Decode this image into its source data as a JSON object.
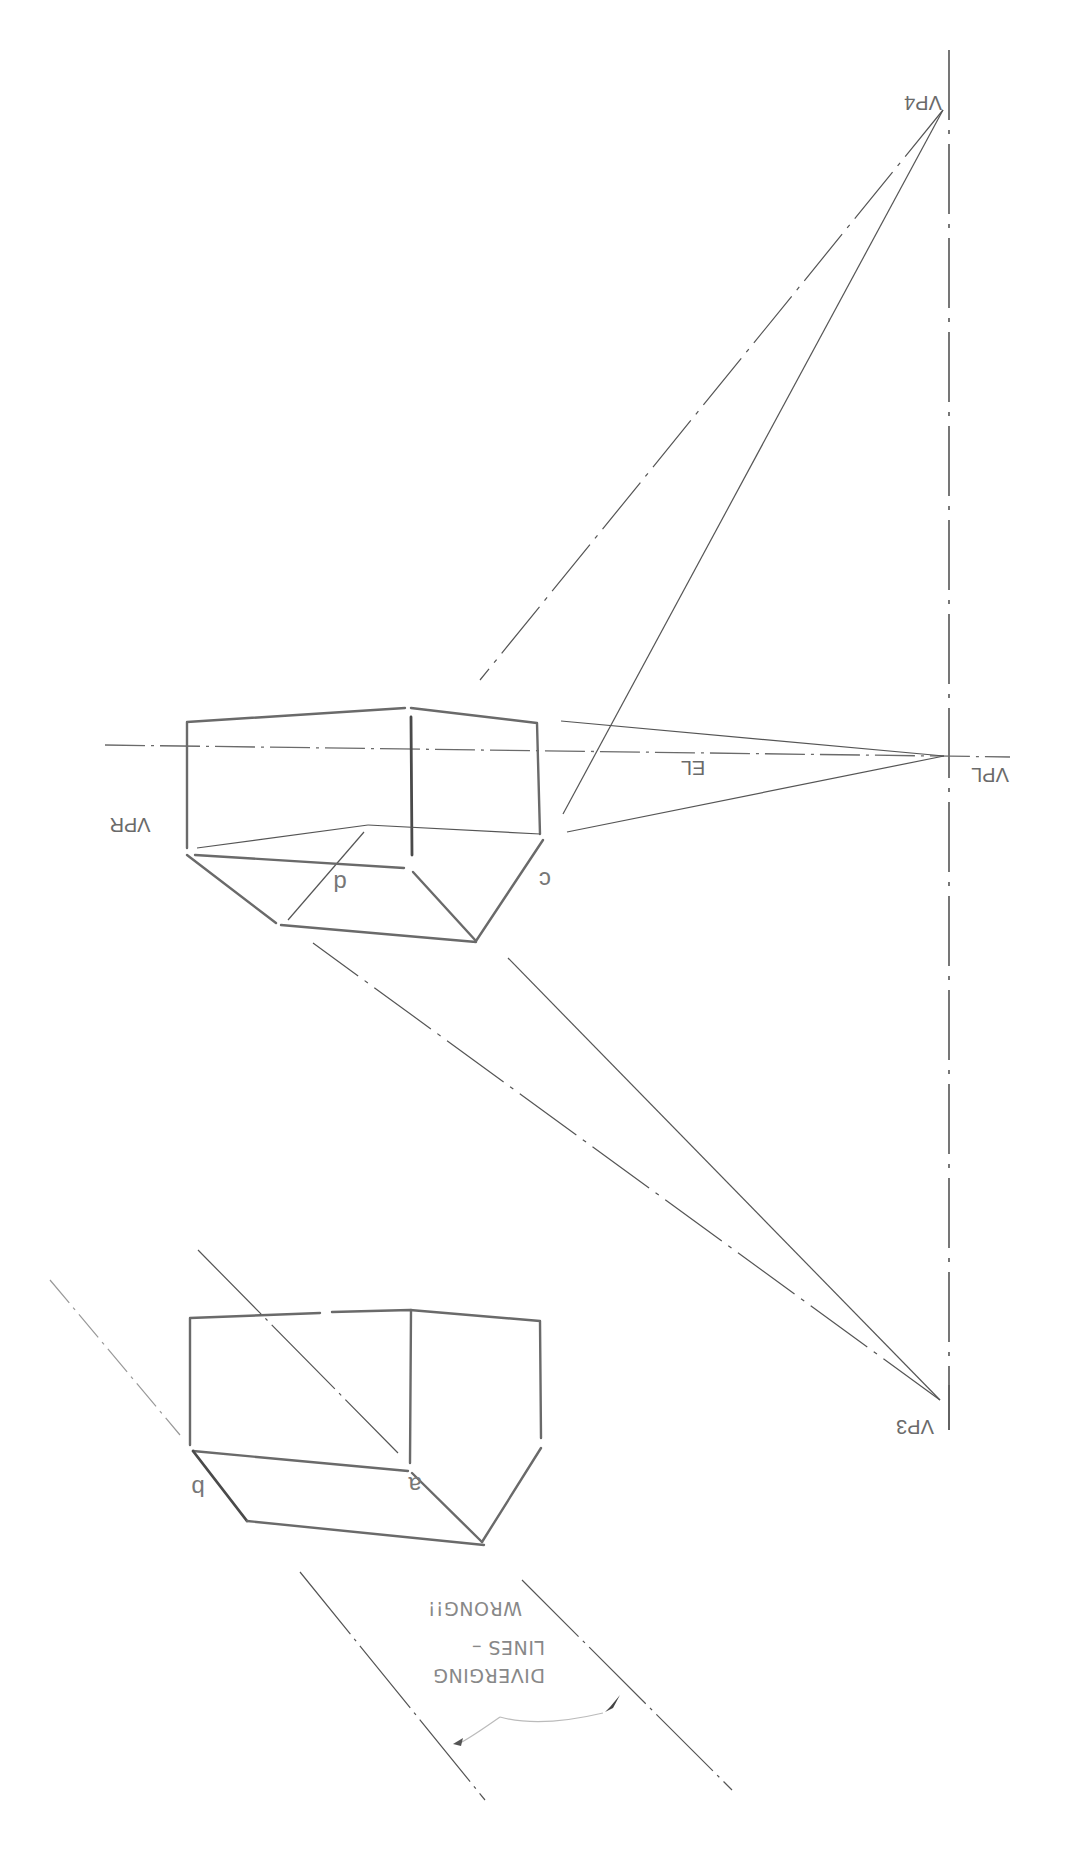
{
  "diagram": {
    "orientation": "rotated 180 degrees",
    "labels": {
      "vp4": "VP4",
      "vp3": "VP3",
      "vpl": "VPL",
      "vpr": "VPR",
      "el": "EL",
      "c": "c",
      "d": "d",
      "a": "a",
      "b": "b"
    },
    "note": {
      "line1": "DIVERGING",
      "line2": "LINES –",
      "line3": "WRONG!!"
    },
    "colors": {
      "pencil": "#6a6a6a",
      "background": "#ffffff"
    }
  }
}
